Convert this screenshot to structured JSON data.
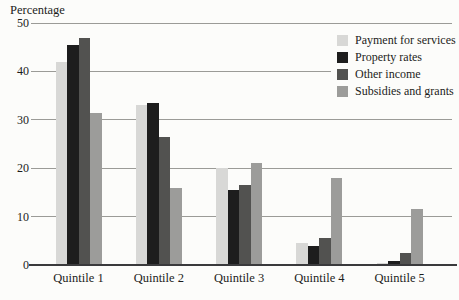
{
  "figure": {
    "background": "#fcfcfa",
    "text_color": "#1c1c1a",
    "gridline_color": "#9b9b97",
    "axis_line_color": "#3a3a3c"
  },
  "chart_data": {
    "type": "bar",
    "title": "",
    "ylabel": "Percentage",
    "xlabel": "",
    "categories": [
      "Quintile 1",
      "Quintile 2",
      "Quintile 3",
      "Quintile 4",
      "Quintile 5"
    ],
    "series": [
      {
        "name": "Payment for services",
        "color": "#d8d8d6",
        "values": [
          42,
          33,
          20,
          4.5,
          0.4
        ]
      },
      {
        "name": "Property rates",
        "color": "#1d1d1d",
        "values": [
          45.5,
          33.5,
          15.5,
          4,
          0.8
        ]
      },
      {
        "name": "Other income",
        "color": "#525250",
        "values": [
          47,
          26.5,
          16.5,
          5.5,
          2.5
        ]
      },
      {
        "name": "Subsidies and grants",
        "color": "#9c9c9a",
        "values": [
          31.5,
          16,
          21,
          18,
          11.5
        ]
      }
    ],
    "ylim": [
      0,
      50
    ],
    "yticks": [
      0,
      10,
      20,
      30,
      40,
      50
    ],
    "grid": true,
    "legend_position": "top-right"
  }
}
